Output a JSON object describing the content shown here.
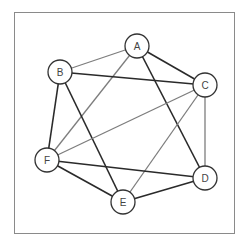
{
  "diagram": {
    "type": "undirected-graph",
    "frame": {
      "x": 14,
      "y": 12,
      "width": 220,
      "height": 221
    },
    "colors": {
      "dark_edge": "#2a2a2a",
      "gray_edge": "#7d7d7d",
      "node_stroke": "#333333",
      "frame": "#8a8a8a"
    },
    "node_radius": 12,
    "nodes": [
      {
        "id": "A",
        "label": "A",
        "x": 137,
        "y": 46
      },
      {
        "id": "B",
        "label": "B",
        "x": 60,
        "y": 72
      },
      {
        "id": "C",
        "label": "C",
        "x": 205,
        "y": 85
      },
      {
        "id": "D",
        "label": "D",
        "x": 205,
        "y": 178
      },
      {
        "id": "E",
        "label": "E",
        "x": 123,
        "y": 202
      },
      {
        "id": "F",
        "label": "F",
        "x": 47,
        "y": 160
      }
    ],
    "edges": [
      {
        "from": "A",
        "to": "B",
        "style": "gray"
      },
      {
        "from": "A",
        "to": "C",
        "style": "dark"
      },
      {
        "from": "A",
        "to": "D",
        "style": "dark"
      },
      {
        "from": "A",
        "to": "F",
        "style": "gray"
      },
      {
        "from": "B",
        "to": "C",
        "style": "dark"
      },
      {
        "from": "B",
        "to": "E",
        "style": "dark"
      },
      {
        "from": "B",
        "to": "F",
        "style": "dark"
      },
      {
        "from": "C",
        "to": "D",
        "style": "gray"
      },
      {
        "from": "C",
        "to": "E",
        "style": "gray"
      },
      {
        "from": "C",
        "to": "F",
        "style": "gray"
      },
      {
        "from": "D",
        "to": "E",
        "style": "dark"
      },
      {
        "from": "D",
        "to": "F",
        "style": "dark"
      },
      {
        "from": "E",
        "to": "F",
        "style": "dark"
      }
    ]
  }
}
